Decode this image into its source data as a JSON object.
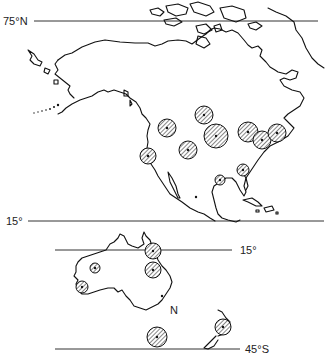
{
  "map": {
    "labels": {
      "lat_75n": "75°N",
      "lat_15_north_panel": "15°",
      "lat_15_south_panel": "15°",
      "lat_45s": "45°S",
      "north_marker": "N"
    },
    "regions": [
      "North America",
      "Australia",
      "New Zealand"
    ],
    "symbol": "hatched-circle",
    "sites_north_america": [
      {
        "x": 167,
        "y": 128,
        "r": 9
      },
      {
        "x": 204,
        "y": 115,
        "r": 9
      },
      {
        "x": 188,
        "y": 150,
        "r": 9
      },
      {
        "x": 216,
        "y": 136,
        "r": 12
      },
      {
        "x": 148,
        "y": 156,
        "r": 8
      },
      {
        "x": 248,
        "y": 132,
        "r": 10
      },
      {
        "x": 262,
        "y": 140,
        "r": 9
      },
      {
        "x": 277,
        "y": 133,
        "r": 9
      },
      {
        "x": 243,
        "y": 170,
        "r": 6
      },
      {
        "x": 220,
        "y": 180,
        "r": 5
      }
    ],
    "sites_australia": [
      {
        "x": 153,
        "y": 251,
        "r": 8
      },
      {
        "x": 153,
        "y": 270,
        "r": 8
      },
      {
        "x": 95,
        "y": 268,
        "r": 5
      },
      {
        "x": 82,
        "y": 287,
        "r": 6
      },
      {
        "x": 157,
        "y": 337,
        "r": 10
      },
      {
        "x": 223,
        "y": 327,
        "r": 8
      }
    ]
  }
}
